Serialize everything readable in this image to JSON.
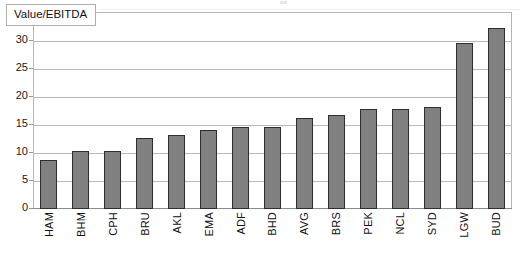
{
  "chart_data": {
    "type": "bar",
    "title": "",
    "legend_label": "Value/EBITDA",
    "legend_position": "top-left-inside",
    "xlabel": "",
    "ylabel": "",
    "ylim": [
      0,
      35
    ],
    "ytick_labels": [
      "0",
      "5",
      "10",
      "15",
      "20",
      "25",
      "30",
      "35"
    ],
    "ytick_values": [
      0,
      5,
      10,
      15,
      20,
      25,
      30,
      35
    ],
    "grid": true,
    "grid_axis": "y",
    "bar_color": "#808080",
    "bar_border_color": "#2e2e2e",
    "categories": [
      "HAM",
      "BHM",
      "CPH",
      "BRU",
      "AKL",
      "EMA",
      "ADF",
      "BHD",
      "AVG",
      "BRS",
      "PEK",
      "NCL",
      "SYD",
      "LGW",
      "BUD"
    ],
    "values": [
      8.8,
      10.3,
      10.3,
      12.6,
      13.3,
      14.1,
      14.7,
      14.7,
      16.3,
      16.8,
      17.8,
      17.9,
      18.2,
      29.7,
      32.3
    ],
    "series": [
      {
        "name": "Value/EBITDA",
        "values": [
          8.8,
          10.3,
          10.3,
          12.6,
          13.3,
          14.1,
          14.7,
          14.7,
          16.3,
          16.8,
          17.8,
          17.9,
          18.2,
          29.7,
          32.3
        ]
      }
    ]
  }
}
